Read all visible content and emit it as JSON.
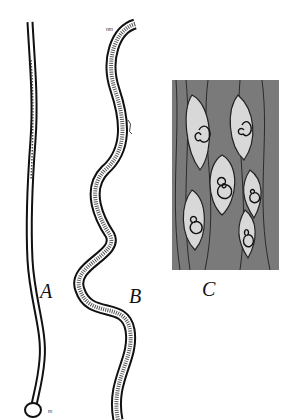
{
  "figure": {
    "panels": [
      {
        "id": "A",
        "label": "A",
        "description": "elongated worm, nearly straight"
      },
      {
        "id": "B",
        "label": "B",
        "description": "wavy worm with granular interior"
      },
      {
        "id": "C",
        "label": "C",
        "description": "muscle tissue with encysted coiled larvae"
      }
    ],
    "annotations": {
      "a_tail": "m",
      "b_head": "nm",
      "b_side": "r"
    },
    "colors": {
      "ink": "#111111",
      "paper": "#ffffff",
      "tissue": "#6a6a6a"
    }
  }
}
